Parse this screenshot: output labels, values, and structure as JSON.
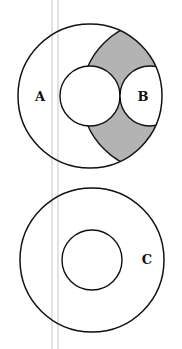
{
  "diagram": {
    "colors": {
      "stroke": "#111111",
      "shade": "#b3b3b3",
      "background": "#ffffff",
      "guide_lines": "#d9d9d9"
    },
    "top_figure": {
      "outer_circle": {
        "cx": 90,
        "cy": 96,
        "r": 72
      },
      "inner_circle": {
        "cx": 90,
        "cy": 96,
        "r": 30
      },
      "circle_b": {
        "cx": 150,
        "cy": 96,
        "r": 30
      },
      "lens_arc_circle": {
        "cx": 157,
        "cy": 96,
        "r": 75
      },
      "labels": {
        "a": "A",
        "b": "B"
      }
    },
    "bottom_figure": {
      "outer_circle": {
        "cx": 92,
        "cy": 260,
        "r": 72
      },
      "inner_circle": {
        "cx": 92,
        "cy": 260,
        "r": 30
      },
      "labels": {
        "c": "C"
      }
    }
  }
}
